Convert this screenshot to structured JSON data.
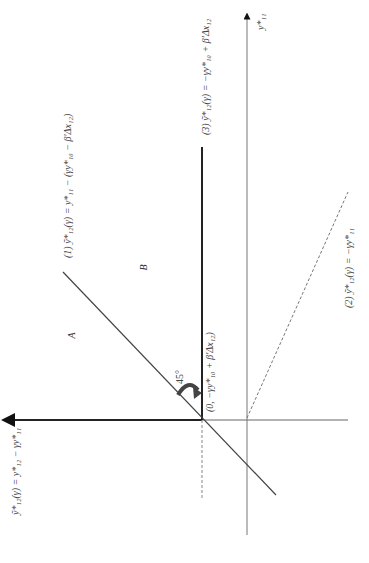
{
  "diagram": {
    "orientation": "rotated -90deg (landscape figure shown in portrait)",
    "axes": {
      "horizontal_label": "ỹ*₁₂(γ) = y*₁₂ − γy*₁₁",
      "vertical_label": "y*₁₁"
    },
    "lines": [
      {
        "id": "1",
        "label": "(1)  ỹ*₁₂(γ) = y*₁₁ − (γy*₁₀ − β′Δx₁₂)",
        "style": "solid"
      },
      {
        "id": "2",
        "label": "(2)  ỹ*₁₂(γ) = −γy*₁₁",
        "style": "dashed"
      },
      {
        "id": "3",
        "label": "(3)  ỹ*₁₂(γ) = −γy*₁₀ + β′Δx₁₂",
        "style": "solid-thick"
      }
    ],
    "point_label": "(0, −γy*₁₀ + β′Δx₁₂)",
    "angle_label": "45°",
    "regions": {
      "a": "A",
      "b": "B"
    },
    "colors": {
      "line": "#555555",
      "thick": "#222222",
      "dashed": "#777777"
    }
  }
}
